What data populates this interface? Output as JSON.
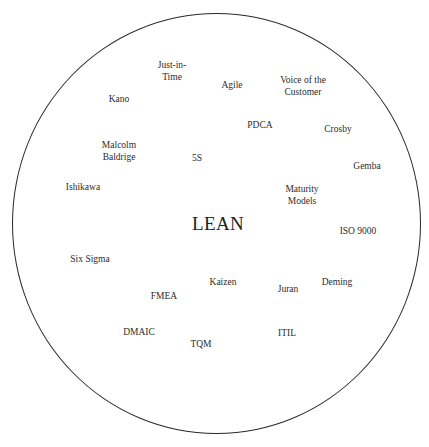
{
  "diagram": {
    "type": "concept-circle",
    "center_label": "LEAN",
    "boundary": {
      "shape": "circle",
      "stroke_color": "#2a2a2a"
    },
    "terms": [
      {
        "id": "just-in-time",
        "lines": [
          "Just-in-",
          "Time"
        ],
        "x": 172,
        "y": 71
      },
      {
        "id": "agile",
        "lines": [
          "Agile"
        ],
        "x": 232,
        "y": 86
      },
      {
        "id": "voice-of-the-customer",
        "lines": [
          "Voice of the",
          "Customer"
        ],
        "x": 303,
        "y": 86
      },
      {
        "id": "kano",
        "lines": [
          "Kano"
        ],
        "x": 119,
        "y": 100
      },
      {
        "id": "pdca",
        "lines": [
          "PDCA"
        ],
        "x": 260,
        "y": 126
      },
      {
        "id": "crosby",
        "lines": [
          "Crosby"
        ],
        "x": 338,
        "y": 130
      },
      {
        "id": "malcolm-baldrige",
        "lines": [
          "Malcolm",
          "Baldrige"
        ],
        "x": 119,
        "y": 151
      },
      {
        "id": "5s",
        "lines": [
          "5S"
        ],
        "x": 197,
        "y": 159
      },
      {
        "id": "gemba",
        "lines": [
          "Gemba"
        ],
        "x": 367,
        "y": 167
      },
      {
        "id": "ishikawa",
        "lines": [
          "Ishikawa"
        ],
        "x": 83,
        "y": 188
      },
      {
        "id": "maturity-models",
        "lines": [
          "Maturity",
          "Models"
        ],
        "x": 302,
        "y": 195
      },
      {
        "id": "iso-9000",
        "lines": [
          "ISO 9000"
        ],
        "x": 358,
        "y": 232
      },
      {
        "id": "six-sigma",
        "lines": [
          "Six Sigma"
        ],
        "x": 90,
        "y": 260
      },
      {
        "id": "kaizen",
        "lines": [
          "Kaizen"
        ],
        "x": 223,
        "y": 283
      },
      {
        "id": "deming",
        "lines": [
          "Deming"
        ],
        "x": 337,
        "y": 283
      },
      {
        "id": "juran",
        "lines": [
          "Juran"
        ],
        "x": 288,
        "y": 290
      },
      {
        "id": "fmea",
        "lines": [
          "FMEA"
        ],
        "x": 164,
        "y": 297
      },
      {
        "id": "dmaic",
        "lines": [
          "DMAIC"
        ],
        "x": 139,
        "y": 333
      },
      {
        "id": "itil",
        "lines": [
          "ITIL"
        ],
        "x": 287,
        "y": 334
      },
      {
        "id": "tqm",
        "lines": [
          "TQM"
        ],
        "x": 201,
        "y": 345
      }
    ]
  }
}
